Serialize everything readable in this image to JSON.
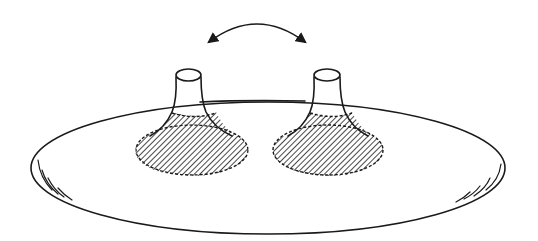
{
  "diagram": {
    "colors": {
      "line": "#1a1a1a",
      "background": "#ffffff",
      "hatch": "#1a1a1a"
    },
    "elements": {
      "disc": {
        "shape": "ellipse",
        "cx": 268,
        "cy": 168,
        "rx": 237,
        "ry": 66
      },
      "peaks": [
        {
          "id": "left-peak",
          "cap_cx": 188,
          "cap_cy": 75,
          "base_cx": 192,
          "base_cy": 150,
          "base_rx": 57,
          "base_ry": 26,
          "hatched": true
        },
        {
          "id": "right-peak",
          "cap_cx": 327,
          "cap_cy": 75,
          "base_cx": 328,
          "base_cy": 150,
          "base_rx": 55,
          "base_ry": 25,
          "hatched": true
        }
      ],
      "arrow": {
        "type": "double-headed-curved",
        "from": [
          207,
          43
        ],
        "to": [
          307,
          43
        ],
        "apex": [
          257,
          24
        ]
      }
    }
  }
}
